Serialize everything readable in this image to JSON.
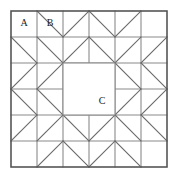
{
  "figure": {
    "name": "quilt-block-diagram",
    "grid": {
      "origin_x": 11,
      "origin_y": 11,
      "cell_size": 26,
      "cols": 6,
      "rows": 6
    },
    "colors": {
      "background": "#ffffff",
      "grid_line": "#8a8a8a",
      "border_line": "#555555",
      "diagonal_line": "#6b6b6b",
      "label_text": "#1a1a1a"
    },
    "stroke_widths": {
      "border": 1.6,
      "grid": 1.1,
      "diagonal": 1.1
    },
    "labels": [
      {
        "id": "label-a",
        "text": "A",
        "col": 0,
        "row": 0
      },
      {
        "id": "label-b",
        "text": "B",
        "col": 1,
        "row": 0
      },
      {
        "id": "label-c",
        "text": "C",
        "col": 3,
        "row": 3
      }
    ],
    "center_square": {
      "col": 2,
      "row": 2,
      "cols": 2,
      "rows": 2
    },
    "grid_lines": {
      "vertical_segments": [
        {
          "col": 1,
          "row_start": 0,
          "row_end": 6
        },
        {
          "col": 2,
          "row_start": 0,
          "row_end": 6
        },
        {
          "col": 3,
          "row_start": 0,
          "row_end": 2
        },
        {
          "col": 3,
          "row_start": 4,
          "row_end": 6
        },
        {
          "col": 4,
          "row_start": 0,
          "row_end": 6
        },
        {
          "col": 5,
          "row_start": 0,
          "row_end": 6
        }
      ],
      "horizontal_segments": [
        {
          "row": 1,
          "col_start": 0,
          "col_end": 6
        },
        {
          "row": 2,
          "col_start": 0,
          "col_end": 6
        },
        {
          "row": 3,
          "col_start": 0,
          "col_end": 2
        },
        {
          "row": 3,
          "col_start": 4,
          "col_end": 6
        },
        {
          "row": 4,
          "col_start": 0,
          "col_end": 6
        },
        {
          "row": 5,
          "col_start": 0,
          "col_end": 6
        }
      ]
    },
    "diagonals": [
      {
        "col": 1,
        "row": 0,
        "dir": "tlbr"
      },
      {
        "col": 2,
        "row": 0,
        "dir": "bltr"
      },
      {
        "col": 3,
        "row": 0,
        "dir": "tlbr"
      },
      {
        "col": 4,
        "row": 0,
        "dir": "bltr"
      },
      {
        "col": 0,
        "row": 1,
        "dir": "tlbr"
      },
      {
        "col": 1,
        "row": 1,
        "dir": "tlbr"
      },
      {
        "col": 2,
        "row": 1,
        "dir": "bltr"
      },
      {
        "col": 3,
        "row": 1,
        "dir": "tlbr"
      },
      {
        "col": 4,
        "row": 1,
        "dir": "bltr"
      },
      {
        "col": 5,
        "row": 1,
        "dir": "bltr"
      },
      {
        "col": 0,
        "row": 2,
        "dir": "bltr"
      },
      {
        "col": 1,
        "row": 2,
        "dir": "bltr"
      },
      {
        "col": 4,
        "row": 2,
        "dir": "tlbr"
      },
      {
        "col": 5,
        "row": 2,
        "dir": "tlbr"
      },
      {
        "col": 0,
        "row": 3,
        "dir": "tlbr"
      },
      {
        "col": 1,
        "row": 3,
        "dir": "tlbr"
      },
      {
        "col": 4,
        "row": 3,
        "dir": "bltr"
      },
      {
        "col": 5,
        "row": 3,
        "dir": "bltr"
      },
      {
        "col": 0,
        "row": 4,
        "dir": "bltr"
      },
      {
        "col": 1,
        "row": 4,
        "dir": "bltr"
      },
      {
        "col": 2,
        "row": 4,
        "dir": "tlbr"
      },
      {
        "col": 3,
        "row": 4,
        "dir": "bltr"
      },
      {
        "col": 4,
        "row": 4,
        "dir": "tlbr"
      },
      {
        "col": 5,
        "row": 4,
        "dir": "tlbr"
      },
      {
        "col": 1,
        "row": 5,
        "dir": "bltr"
      },
      {
        "col": 2,
        "row": 5,
        "dir": "tlbr"
      },
      {
        "col": 3,
        "row": 5,
        "dir": "bltr"
      },
      {
        "col": 4,
        "row": 5,
        "dir": "tlbr"
      }
    ]
  }
}
